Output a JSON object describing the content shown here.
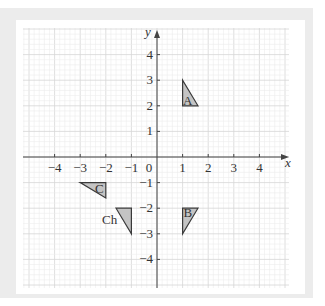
{
  "diagram": {
    "type": "coordinate-grid",
    "axes": {
      "x_label": "x",
      "y_label": "y",
      "origin_label": "0",
      "x_ticks": [
        {
          "value": -4,
          "label": "−4"
        },
        {
          "value": -3,
          "label": "−3"
        },
        {
          "value": -2,
          "label": "−2"
        },
        {
          "value": -1,
          "label": "−1"
        },
        {
          "value": 1,
          "label": "1"
        },
        {
          "value": 2,
          "label": "2"
        },
        {
          "value": 3,
          "label": "3"
        },
        {
          "value": 4,
          "label": "4"
        }
      ],
      "y_ticks": [
        {
          "value": 4,
          "label": "4"
        },
        {
          "value": 3,
          "label": "3"
        },
        {
          "value": 2,
          "label": "2"
        },
        {
          "value": 1,
          "label": "1"
        },
        {
          "value": -1,
          "label": "−1"
        },
        {
          "value": -2,
          "label": "−2"
        },
        {
          "value": -3,
          "label": "−3"
        },
        {
          "value": -4,
          "label": "−4"
        }
      ],
      "x_range": [
        -4.9,
        5.2
      ],
      "y_range": [
        -4.9,
        5.1
      ],
      "grid": "minor 0.2, major 1"
    },
    "shapes": [
      {
        "name": "A",
        "label": "A",
        "points": [
          [
            1,
            3
          ],
          [
            1,
            2
          ],
          [
            1.6,
            2
          ]
        ],
        "label_at": [
          1.2,
          2.2
        ]
      },
      {
        "name": "B",
        "label": "B",
        "points": [
          [
            1,
            -2
          ],
          [
            1.6,
            -2
          ],
          [
            1,
            -3
          ]
        ],
        "label_at": [
          1.2,
          -2.2
        ]
      },
      {
        "name": "C",
        "label": "C",
        "points": [
          [
            -3,
            -1
          ],
          [
            -2,
            -1
          ],
          [
            -2,
            -1.6
          ]
        ],
        "label_at": [
          -2.25,
          -1.25
        ]
      },
      {
        "name": "Ch",
        "label": "Ch",
        "points": [
          [
            -1.6,
            -2
          ],
          [
            -1,
            -2
          ],
          [
            -1,
            -3
          ]
        ],
        "label_at": [
          -1.85,
          -2.45
        ]
      }
    ],
    "colors": {
      "shape_fill": "#c4c4c4",
      "shape_stroke": "#3a3a3a",
      "axis": "#444444",
      "grid_minor": "#ececec",
      "grid_major": "#d6d6d6",
      "frame": "#ececec"
    }
  }
}
